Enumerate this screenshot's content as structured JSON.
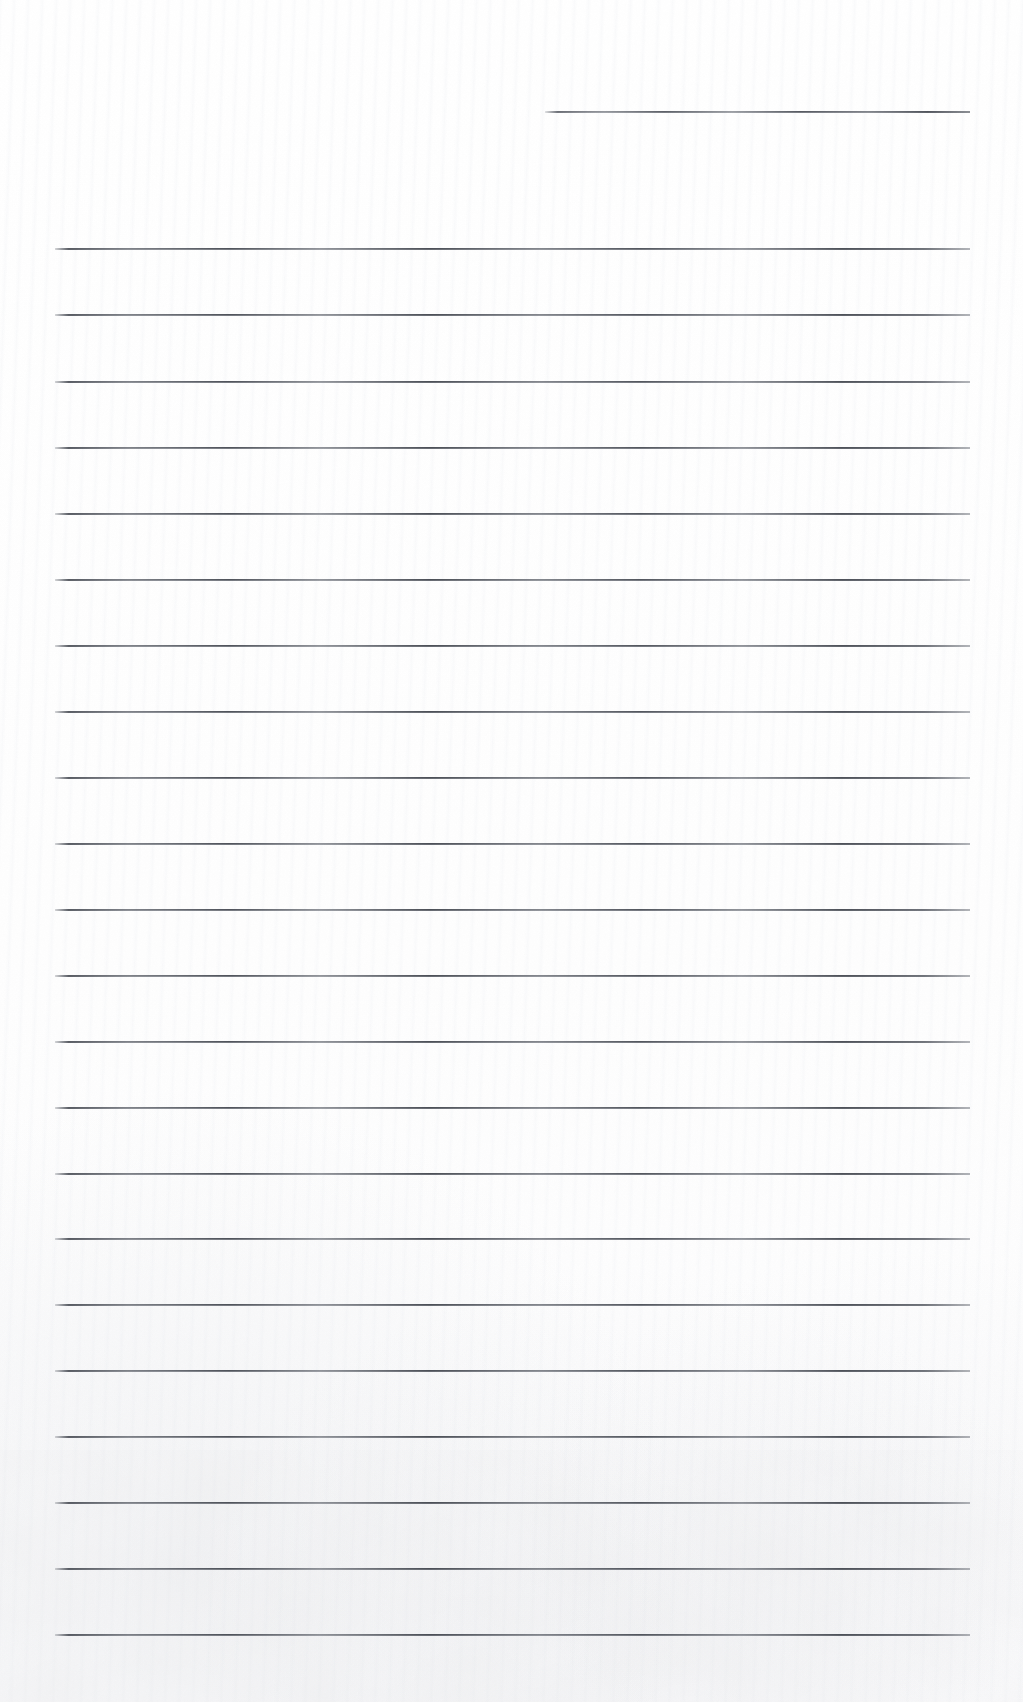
{
  "document": {
    "kind": "scanned-lined-form",
    "title": "Blank lined form page",
    "page_width": 1023,
    "page_height": 1702,
    "background_color": "#fefefe",
    "rule_color": "#4a4e56",
    "text_content": "",
    "visible_text": []
  },
  "layout": {
    "content_left": 55,
    "content_right": 970,
    "short_rule_left": 545,
    "short_rule_right": 970,
    "first_rule_y": 111,
    "body_first_rule_y": 248,
    "rule_spacing": 66.3,
    "rule_thickness": 2,
    "body_rule_count": 22
  },
  "rules": [
    {
      "id": "rule-header",
      "type": "short",
      "x": 545,
      "y": 111,
      "width": 425
    },
    {
      "id": "rule-1",
      "type": "full",
      "x": 55,
      "y": 248,
      "width": 915
    },
    {
      "id": "rule-2",
      "type": "full",
      "x": 55,
      "y": 314,
      "width": 915
    },
    {
      "id": "rule-3",
      "type": "full",
      "x": 55,
      "y": 381,
      "width": 915
    },
    {
      "id": "rule-4",
      "type": "full",
      "x": 55,
      "y": 447,
      "width": 915
    },
    {
      "id": "rule-5",
      "type": "full",
      "x": 55,
      "y": 513,
      "width": 915
    },
    {
      "id": "rule-6",
      "type": "full",
      "x": 55,
      "y": 579,
      "width": 915
    },
    {
      "id": "rule-7",
      "type": "full",
      "x": 55,
      "y": 645,
      "width": 915
    },
    {
      "id": "rule-8",
      "type": "full",
      "x": 55,
      "y": 711,
      "width": 915
    },
    {
      "id": "rule-9",
      "type": "full",
      "x": 55,
      "y": 777,
      "width": 915
    },
    {
      "id": "rule-10",
      "type": "full",
      "x": 55,
      "y": 843,
      "width": 915
    },
    {
      "id": "rule-11",
      "type": "full",
      "x": 55,
      "y": 909,
      "width": 915
    },
    {
      "id": "rule-12",
      "type": "full",
      "x": 55,
      "y": 975,
      "width": 915
    },
    {
      "id": "rule-13",
      "type": "full",
      "x": 55,
      "y": 1041,
      "width": 915
    },
    {
      "id": "rule-14",
      "type": "full",
      "x": 55,
      "y": 1107,
      "width": 915
    },
    {
      "id": "rule-15",
      "type": "full",
      "x": 55,
      "y": 1173,
      "width": 915
    },
    {
      "id": "rule-16",
      "type": "full",
      "x": 55,
      "y": 1238,
      "width": 915
    },
    {
      "id": "rule-17",
      "type": "full",
      "x": 55,
      "y": 1304,
      "width": 915
    },
    {
      "id": "rule-18",
      "type": "full",
      "x": 55,
      "y": 1370,
      "width": 915
    },
    {
      "id": "rule-19",
      "type": "full",
      "x": 55,
      "y": 1436,
      "width": 915
    },
    {
      "id": "rule-20",
      "type": "full",
      "x": 55,
      "y": 1502,
      "width": 915
    },
    {
      "id": "rule-21",
      "type": "full",
      "x": 55,
      "y": 1568,
      "width": 915
    },
    {
      "id": "rule-22",
      "type": "full",
      "x": 55,
      "y": 1634,
      "width": 915
    }
  ]
}
